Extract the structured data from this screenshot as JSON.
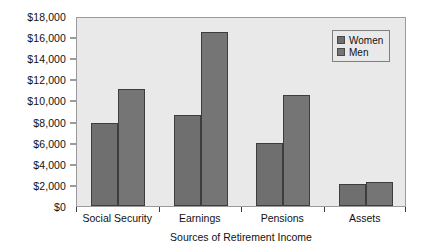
{
  "chart_data": {
    "type": "bar",
    "title": "",
    "xlabel": "Sources of Retirement Income",
    "ylabel": "",
    "categories": [
      "Social Security",
      "Earnings",
      "Pensions",
      "Assets"
    ],
    "series": [
      {
        "name": "Women",
        "color": "#6f6f6f",
        "values": [
          7900,
          8600,
          6000,
          2100
        ]
      },
      {
        "name": "Men",
        "color": "#757575",
        "values": [
          11100,
          16500,
          10500,
          2250
        ]
      }
    ],
    "ylim": [
      0,
      18000
    ],
    "ytick_values": [
      0,
      2000,
      4000,
      6000,
      8000,
      10000,
      12000,
      14000,
      16000,
      18000
    ],
    "ytick_labels": [
      "$0",
      "$2,000",
      "$4,000",
      "$6,000",
      "$8,000",
      "$10,000",
      "$12,000",
      "$14,000",
      "$16,000",
      "$18,000"
    ],
    "grid": false,
    "legend_position": "top-right",
    "plot_background": "#e9e9e9",
    "frame_color": "#9a9a9a"
  }
}
